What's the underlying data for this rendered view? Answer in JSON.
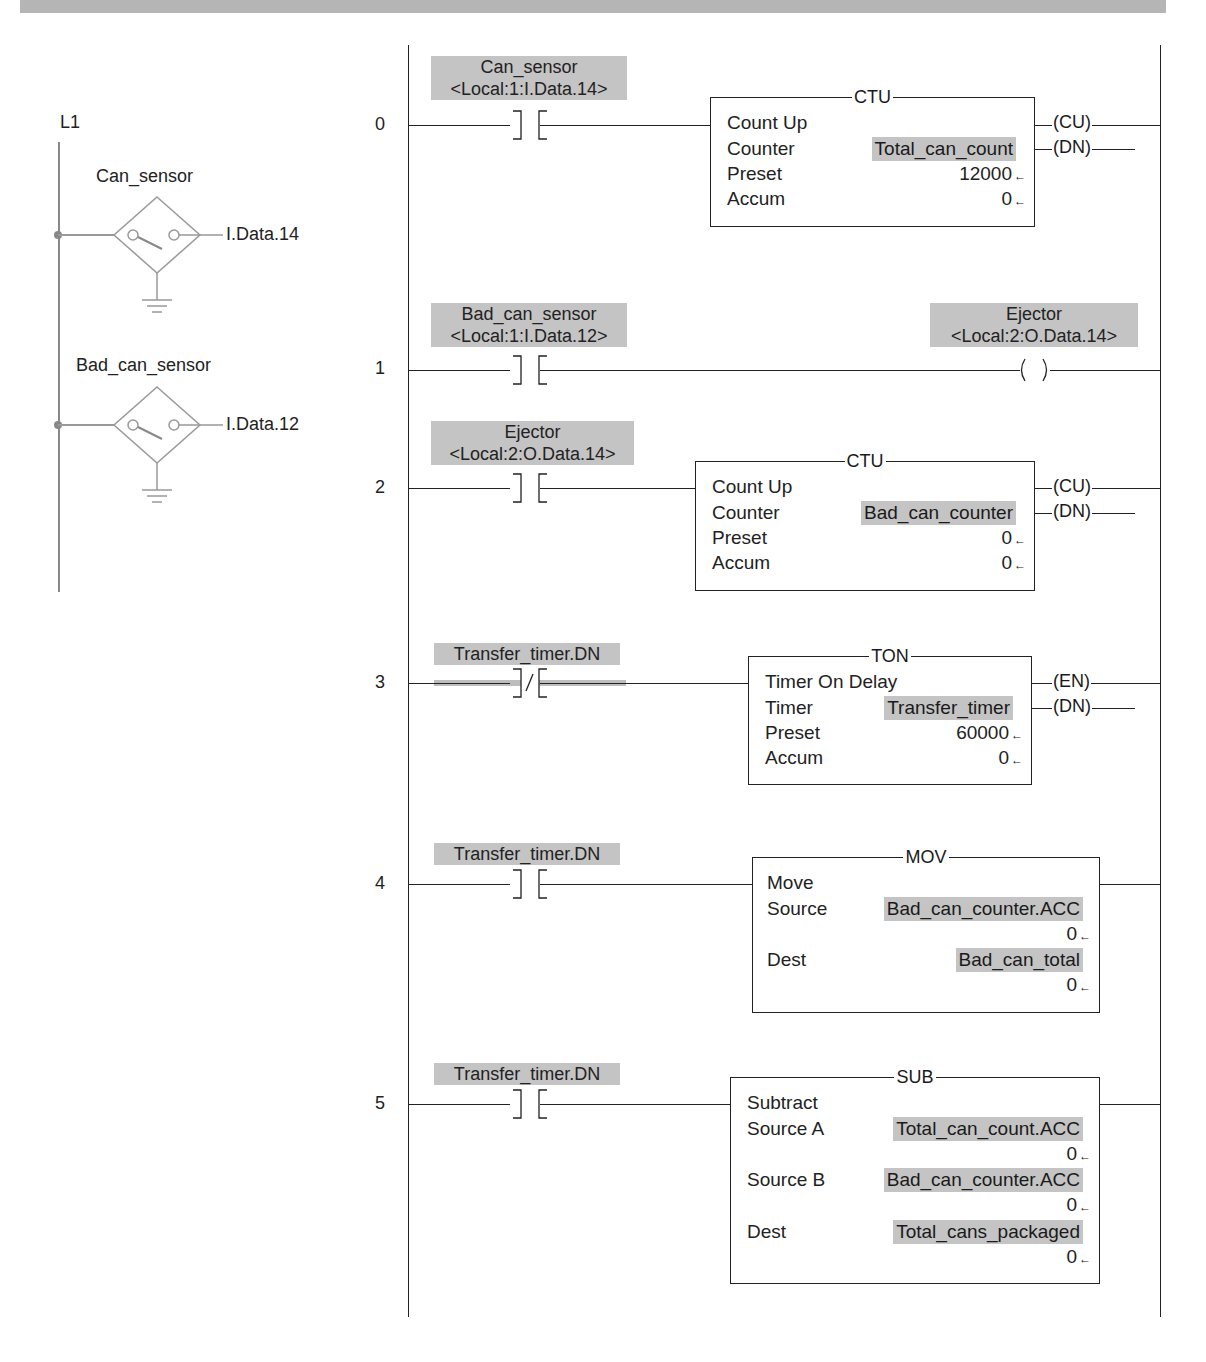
{
  "header_bar": {
    "color": "#b5b5b5"
  },
  "wiring": {
    "rail_label": "L1",
    "sensors": [
      {
        "name": "Can_sensor",
        "address": "I.Data.14"
      },
      {
        "name": "Bad_can_sensor",
        "address": "I.Data.12"
      }
    ]
  },
  "ladder": {
    "rungs": [
      {
        "number": "0",
        "contact": {
          "type": "XIC",
          "tag": "Can_sensor",
          "alias": "<Local:1:I.Data.14>"
        },
        "instruction": {
          "mnemonic": "CTU",
          "description": "Count Up",
          "rows": [
            {
              "label": "Counter",
              "value": "Total_can_count"
            },
            {
              "label": "Preset",
              "value": "12000"
            },
            {
              "label": "Accum",
              "value": "0"
            }
          ],
          "outputs": [
            "CU",
            "DN"
          ]
        }
      },
      {
        "number": "1",
        "contact": {
          "type": "XIC",
          "tag": "Bad_can_sensor",
          "alias": "<Local:1:I.Data.12>"
        },
        "coil": {
          "type": "OTE",
          "tag": "Ejector",
          "alias": "<Local:2:O.Data.14>"
        }
      },
      {
        "number": "2",
        "contact": {
          "type": "XIC",
          "tag": "Ejector",
          "alias": "<Local:2:O.Data.14>"
        },
        "instruction": {
          "mnemonic": "CTU",
          "description": "Count Up",
          "rows": [
            {
              "label": "Counter",
              "value": "Bad_can_counter"
            },
            {
              "label": "Preset",
              "value": "0"
            },
            {
              "label": "Accum",
              "value": "0"
            }
          ],
          "outputs": [
            "CU",
            "DN"
          ]
        }
      },
      {
        "number": "3",
        "contact": {
          "type": "XIO",
          "tag": "Transfer_timer.DN"
        },
        "instruction": {
          "mnemonic": "TON",
          "description": "Timer On Delay",
          "rows": [
            {
              "label": "Timer",
              "value": "Transfer_timer"
            },
            {
              "label": "Preset",
              "value": "60000"
            },
            {
              "label": "Accum",
              "value": "0"
            }
          ],
          "outputs": [
            "EN",
            "DN"
          ]
        }
      },
      {
        "number": "4",
        "contact": {
          "type": "XIC",
          "tag": "Transfer_timer.DN"
        },
        "instruction": {
          "mnemonic": "MOV",
          "description": "Move",
          "rows": [
            {
              "label": "Source",
              "value": "Bad_can_counter.ACC",
              "live": "0"
            },
            {
              "label": "Dest",
              "value": "Bad_can_total",
              "live": "0"
            }
          ]
        }
      },
      {
        "number": "5",
        "contact": {
          "type": "XIC",
          "tag": "Transfer_timer.DN"
        },
        "instruction": {
          "mnemonic": "SUB",
          "description": "Subtract",
          "rows": [
            {
              "label": "Source A",
              "value": "Total_can_count.ACC",
              "live": "0"
            },
            {
              "label": "Source B",
              "value": "Bad_can_counter.ACC",
              "live": "0"
            },
            {
              "label": "Dest",
              "value": "Total_cans_packaged",
              "live": "0"
            }
          ]
        }
      }
    ]
  }
}
